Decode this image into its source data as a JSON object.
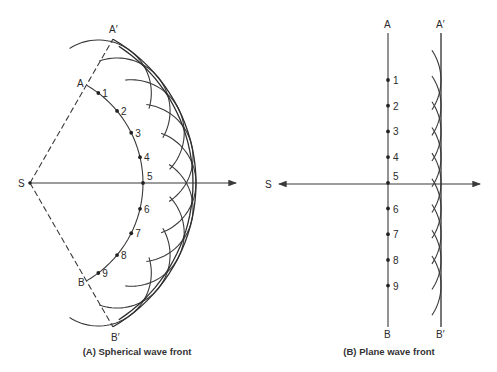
{
  "diagram": {
    "panels": [
      {
        "id": "spherical",
        "caption": "(A) Spherical wave front",
        "source_label": "S",
        "primary_front": {
          "start_label": "A",
          "end_label": "B"
        },
        "secondary_front": {
          "start_label": "A′",
          "end_label": "B′"
        },
        "points": [
          "1",
          "2",
          "3",
          "4",
          "5",
          "6",
          "7",
          "8",
          "9"
        ]
      },
      {
        "id": "plane",
        "caption": "(B) Plane wave front",
        "source_label": "S",
        "primary_front": {
          "start_label": "A",
          "end_label": "B"
        },
        "secondary_front": {
          "start_label": "A′",
          "end_label": "B′"
        },
        "points": [
          "1",
          "2",
          "3",
          "4",
          "5",
          "6",
          "7",
          "8",
          "9"
        ]
      }
    ],
    "colors": {
      "line": "#3a3a3a",
      "text": "#2a2a2a",
      "background": "#ffffff"
    }
  }
}
